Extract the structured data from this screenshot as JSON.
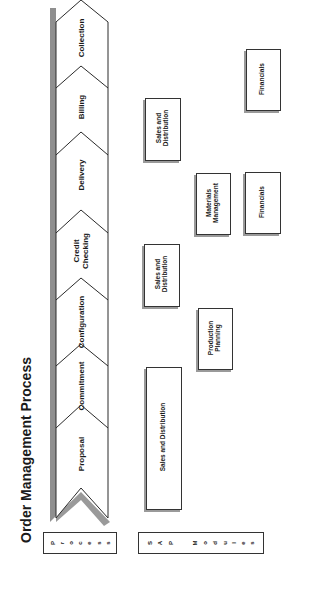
{
  "title": "Order Management Process",
  "process_steps": [
    {
      "label": "Proposal"
    },
    {
      "label": "Commitment"
    },
    {
      "label": "Configuration"
    },
    {
      "label": "Credit\nChecking",
      "line1": "Credit",
      "line2": "Checking"
    },
    {
      "label": "Delivery"
    },
    {
      "label": "Billing"
    },
    {
      "label": "Collection"
    }
  ],
  "row_labels": {
    "process": "Process",
    "process_letters": [
      "P",
      "r",
      "o",
      "c",
      "e",
      "s",
      "s"
    ],
    "sap_modules": "SAP Modules",
    "sap_letters": [
      "S",
      "A",
      "P",
      "",
      "M",
      "o",
      "d",
      "u",
      "l",
      "e",
      "s"
    ]
  },
  "modules": [
    {
      "label": "Sales and Distribution",
      "step": "Proposal-Commitment"
    },
    {
      "label": "Production Planning",
      "line1": "Production",
      "line2": "Planning",
      "step": "Configuration"
    },
    {
      "label": "Sales and Distribution",
      "line1": "Sales and",
      "line2": "Distribution",
      "step": "Credit Checking"
    },
    {
      "label": "Materials Management",
      "line1": "Materials",
      "line2": "Management",
      "step": "Delivery"
    },
    {
      "label": "Financials",
      "step": "Delivery"
    },
    {
      "label": "Sales and Distribution",
      "line1": "Sales and",
      "line2": "Distribution",
      "step": "Billing"
    },
    {
      "label": "Financials",
      "step": "Collection"
    }
  ],
  "colors": {
    "line": "#2a2a2a",
    "shadow": "#8f8f8f",
    "background": "#ffffff"
  }
}
